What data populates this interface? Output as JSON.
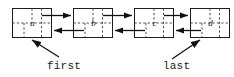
{
  "figure": {
    "kind": "doubly-linked-list-diagram",
    "background_color": "#ffffff",
    "line_color": "#111111",
    "box_stroke_color": "#1d1d1d",
    "dashed_divider_color": "#4a4a4a",
    "text_color": "#1a1a1a"
  },
  "nodes": [
    {
      "id": "node-a",
      "label": "a",
      "x": 12,
      "y": 8,
      "width": 40,
      "height": 30
    },
    {
      "id": "node-b",
      "label": "b",
      "x": 73,
      "y": 8,
      "width": 40,
      "height": 30
    },
    {
      "id": "node-c",
      "label": "c",
      "x": 134,
      "y": 8,
      "width": 40,
      "height": 30
    },
    {
      "id": "node-d",
      "label": "d",
      "x": 190,
      "y": 8,
      "width": 40,
      "height": 30
    }
  ],
  "links": [
    {
      "id": "link-a-b-next",
      "direction": "forward",
      "from": "a",
      "to": "b"
    },
    {
      "id": "link-b-a-prev",
      "direction": "backward",
      "from": "b",
      "to": "a"
    },
    {
      "id": "link-b-c-next",
      "direction": "forward",
      "from": "b",
      "to": "c"
    },
    {
      "id": "link-c-b-prev",
      "direction": "backward",
      "from": "c",
      "to": "b"
    },
    {
      "id": "link-c-d-next",
      "direction": "forward",
      "from": "c",
      "to": "d"
    },
    {
      "id": "link-d-c-prev",
      "direction": "backward",
      "from": "d",
      "to": "c"
    }
  ],
  "pointers": [
    {
      "id": "pointer-first",
      "label": "first",
      "target_node": "a",
      "label_x": 47,
      "label_y": 69
    },
    {
      "id": "pointer-last",
      "label": "last",
      "target_node": "d",
      "label_x": 163,
      "label_y": 69
    }
  ]
}
